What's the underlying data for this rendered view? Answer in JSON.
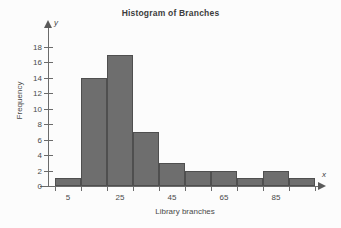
{
  "chart_data": {
    "type": "bar",
    "title": "Histogram of Branches",
    "xlabel": "Library branches",
    "ylabel": "Frequency",
    "x_axis_variable": "x",
    "y_axis_variable": "y",
    "categories": [
      "5",
      "15",
      "25",
      "35",
      "45",
      "55",
      "65",
      "75",
      "85",
      "95"
    ],
    "values": [
      1,
      14,
      17,
      7,
      3,
      2,
      2,
      1,
      2,
      1
    ],
    "bar_color": "#6e6e6e",
    "bar_border_color": "#4f4f4f",
    "background_color": "#fcfcfc",
    "axis_color": "#6b6b6b",
    "grid": false,
    "legend": "none",
    "xlim": [
      0,
      10
    ],
    "ylim": [
      0,
      18
    ],
    "ytick_values": [
      0,
      2,
      4,
      6,
      8,
      10,
      12,
      14,
      16,
      18
    ],
    "ytick_labels": [
      "0",
      "2",
      "4",
      "6",
      "8",
      "10",
      "12",
      "14",
      "16",
      "18"
    ],
    "xtick_labels": [
      "5",
      "25",
      "45",
      "65",
      "85"
    ],
    "xtick_bar_index": [
      0,
      2,
      4,
      6,
      8
    ]
  }
}
